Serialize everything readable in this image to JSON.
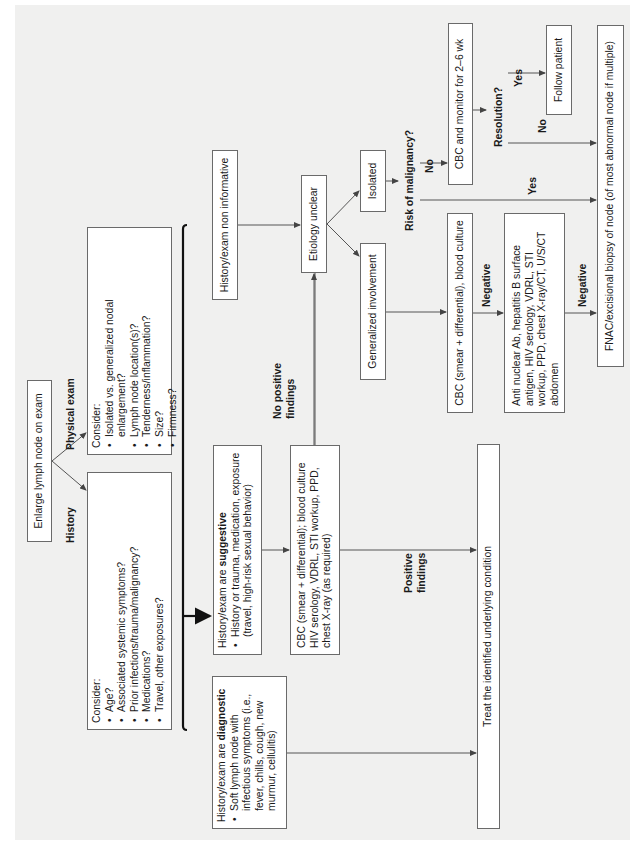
{
  "diagram": {
    "type": "flowchart",
    "orientation": "rotated-90-ccw",
    "start": "Enlarge lymph node on exam",
    "branch_labels": {
      "history": "History",
      "physical_exam": "Physical exam"
    },
    "history_box": {
      "heading": "Consider:",
      "items": [
        "Age?",
        "Associated systemic symptoms?",
        "Prior infections/trauma/malignancy?",
        "Medications?",
        "Travel, other exposures?"
      ]
    },
    "physical_box": {
      "heading": "Consider:",
      "items": [
        "Isolated vs. generalized nodal enlargement?",
        "Lymph node location(s)?",
        "Tenderness/inflammation?",
        "Size?",
        "Firmness?"
      ]
    },
    "diagnostic_box": {
      "heading_prefix": "History/exam are ",
      "heading_bold": "diagnostic",
      "item": "Soft lymph node with infectious symptoms (i.e., fever, chills, cough, new murmur, cellulitis)"
    },
    "suggestive_box": {
      "heading_prefix": "History/exam are ",
      "heading_bold": "suggestive",
      "item": "History or trauma, medication, exposure (travel, high-risk sexual behavior)"
    },
    "non_informative_box": "History/exam non informative",
    "cbc_workup_box": "CBC (smear + differential); blood culture HIV serology, VDRL, STI workup, PPD, chest X-ray (as required)",
    "edge_labels": {
      "no_positive": "No positive findings",
      "positive": "Positive findings",
      "risk": "Risk of malignancy?",
      "risk_no": "No",
      "risk_yes": "Yes",
      "resolution": "Resolution?",
      "resolution_yes": "Yes",
      "resolution_no": "No",
      "negative_1": "Negative",
      "negative_2": "Negative"
    },
    "treat_box": "Treat the identified underlying condition",
    "etiology_box": "Etiology unclear",
    "isolated_box": "Isolated",
    "generalized_box": "Generalized involvement",
    "cbc_culture_box": "CBC (smear + differential), blood culture",
    "antinuclear_box": "Anti nuclear Ab, hepatitis B surface antigen, HIV serology, VDRL, STI workup, PPD, chest X-ray/CT, U/S/CT abdomen",
    "cbc_monitor_box": "CBC and monitor for 2–6 wk",
    "follow_box": "Follow patient",
    "fnac_box": "FNAC/excisional biopsy of node (of most abnormal node if multiple)",
    "colors": {
      "panel": "#f0f0ef",
      "box_border": "#6a6a6a",
      "line": "#555555",
      "text": "#1a1a1a"
    }
  }
}
